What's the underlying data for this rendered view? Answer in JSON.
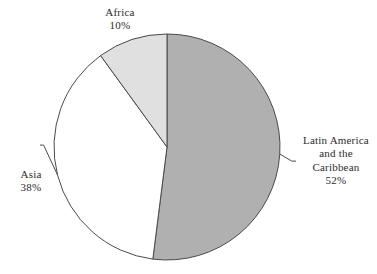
{
  "chart_data": {
    "type": "pie",
    "title": "",
    "categories": [
      "Latin America and the Caribbean",
      "Asia",
      "Africa"
    ],
    "values": [
      52,
      38,
      10
    ],
    "value_unit": "%",
    "legend_position": "none",
    "labels_outside": true,
    "start_angle_deg": 0,
    "direction": "clockwise",
    "slices": [
      {
        "name": "Latin America and the Caribbean",
        "label_line1": "Latin America",
        "label_line2": "and the",
        "label_line3": "Caribbean",
        "percent_text": "52%",
        "value": 52,
        "color": "#b0b0b0",
        "has_leader": true
      },
      {
        "name": "Asia",
        "label_line1": "Asia",
        "percent_text": "38%",
        "value": 38,
        "color": "#ffffff",
        "has_leader": true
      },
      {
        "name": "Africa",
        "label_line1": "Africa",
        "percent_text": "10%",
        "value": 10,
        "color": "#e0e0e0",
        "has_leader": false
      }
    ]
  },
  "colors": {
    "background": "#ffffff",
    "outline": "#4a4a4a",
    "text": "#2b2b2b",
    "latin_america_fill": "#b0b0b0",
    "asia_fill": "#ffffff",
    "africa_fill": "#e0e0e0"
  },
  "geometry": {
    "center_x": 167,
    "center_y": 147,
    "radius": 113
  }
}
